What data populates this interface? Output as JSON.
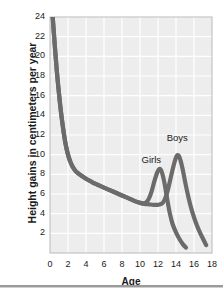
{
  "chart_data": {
    "type": "line",
    "title": "",
    "xlabel": "Age",
    "ylabel": "Height gains in centimeters per year",
    "xlim": [
      0,
      18
    ],
    "ylim": [
      0,
      24
    ],
    "xticks": [
      0,
      2,
      4,
      6,
      8,
      10,
      12,
      14,
      16,
      18
    ],
    "yticks": [
      2,
      4,
      6,
      8,
      10,
      12,
      14,
      16,
      18,
      20,
      22,
      24
    ],
    "grid": true,
    "legend_position": "inline-annotations",
    "line_color": "#6b6b6b",
    "plot_background": "#ededed",
    "grid_color": "#ffffff",
    "annotations": [
      {
        "text": "Girls",
        "x": 11.5,
        "y": 9.4
      },
      {
        "text": "Boys",
        "x": 14.3,
        "y": 11.6
      }
    ],
    "series": [
      {
        "name": "Girls",
        "points": [
          [
            0.3,
            24.0
          ],
          [
            0.5,
            21.5
          ],
          [
            0.75,
            18.6
          ],
          [
            1.0,
            16.2
          ],
          [
            1.25,
            14.1
          ],
          [
            1.5,
            12.4
          ],
          [
            1.75,
            11.0
          ],
          [
            2.0,
            10.0
          ],
          [
            2.25,
            9.3
          ],
          [
            2.5,
            8.8
          ],
          [
            2.75,
            8.45
          ],
          [
            3.0,
            8.2
          ],
          [
            3.5,
            7.85
          ],
          [
            4.0,
            7.55
          ],
          [
            4.5,
            7.3
          ],
          [
            5.0,
            7.05
          ],
          [
            5.5,
            6.85
          ],
          [
            6.0,
            6.65
          ],
          [
            6.5,
            6.45
          ],
          [
            7.0,
            6.25
          ],
          [
            7.5,
            6.05
          ],
          [
            8.0,
            5.85
          ],
          [
            8.5,
            5.65
          ],
          [
            9.0,
            5.45
          ],
          [
            9.5,
            5.25
          ],
          [
            10.0,
            5.1
          ],
          [
            10.4,
            5.05
          ],
          [
            10.7,
            5.15
          ],
          [
            11.0,
            5.55
          ],
          [
            11.3,
            6.3
          ],
          [
            11.6,
            7.3
          ],
          [
            11.9,
            8.15
          ],
          [
            12.15,
            8.55
          ],
          [
            12.4,
            8.3
          ],
          [
            12.7,
            7.2
          ],
          [
            13.0,
            5.6
          ],
          [
            13.3,
            4.1
          ],
          [
            13.6,
            3.0
          ],
          [
            14.0,
            2.1
          ],
          [
            14.4,
            1.4
          ],
          [
            14.8,
            0.85
          ],
          [
            15.1,
            0.55
          ]
        ]
      },
      {
        "name": "Boys",
        "points": [
          [
            0.3,
            24.0
          ],
          [
            0.5,
            21.5
          ],
          [
            0.75,
            18.6
          ],
          [
            1.0,
            16.2
          ],
          [
            1.25,
            14.1
          ],
          [
            1.5,
            12.4
          ],
          [
            1.75,
            11.0
          ],
          [
            2.0,
            10.0
          ],
          [
            2.25,
            9.3
          ],
          [
            2.5,
            8.8
          ],
          [
            2.75,
            8.45
          ],
          [
            3.0,
            8.2
          ],
          [
            3.5,
            7.85
          ],
          [
            4.0,
            7.55
          ],
          [
            4.5,
            7.3
          ],
          [
            5.0,
            7.05
          ],
          [
            5.5,
            6.85
          ],
          [
            6.0,
            6.65
          ],
          [
            6.5,
            6.45
          ],
          [
            7.0,
            6.25
          ],
          [
            7.5,
            6.05
          ],
          [
            8.0,
            5.85
          ],
          [
            8.5,
            5.65
          ],
          [
            9.0,
            5.45
          ],
          [
            9.5,
            5.25
          ],
          [
            10.0,
            5.1
          ],
          [
            10.5,
            5.0
          ],
          [
            11.0,
            4.95
          ],
          [
            11.5,
            4.9
          ],
          [
            12.0,
            4.9
          ],
          [
            12.4,
            5.0
          ],
          [
            12.7,
            5.35
          ],
          [
            13.0,
            6.1
          ],
          [
            13.3,
            7.2
          ],
          [
            13.6,
            8.4
          ],
          [
            13.9,
            9.45
          ],
          [
            14.15,
            9.95
          ],
          [
            14.4,
            9.7
          ],
          [
            14.7,
            8.7
          ],
          [
            15.0,
            7.3
          ],
          [
            15.4,
            5.6
          ],
          [
            15.8,
            4.2
          ],
          [
            16.2,
            3.1
          ],
          [
            16.6,
            2.2
          ],
          [
            17.0,
            1.45
          ],
          [
            17.35,
            0.8
          ]
        ]
      }
    ]
  },
  "axis": {
    "x_title": "Age",
    "y_title": "Height gains in centimeters per year"
  }
}
